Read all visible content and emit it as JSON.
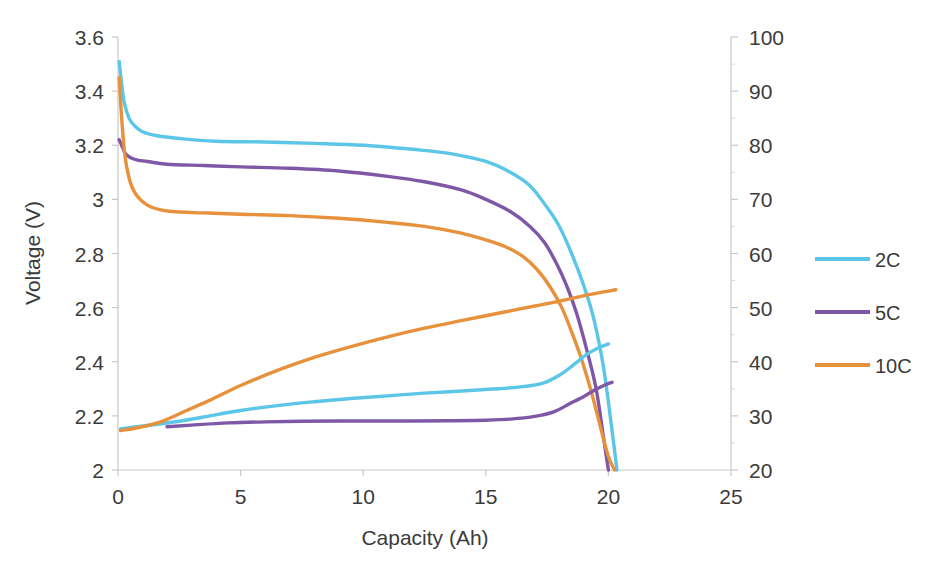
{
  "chart_data": {
    "type": "line",
    "title": "",
    "xlabel": "Capacity (Ah)",
    "ylabel": "Voltage (V)",
    "y2label": "",
    "xlim": [
      0,
      25
    ],
    "ylim": [
      2,
      3.6
    ],
    "y2lim": [
      20,
      100
    ],
    "grid": false,
    "legend_position": "right",
    "xticks": [
      "0",
      "5",
      "10",
      "15",
      "20",
      "25"
    ],
    "xtick_values": [
      0,
      5,
      10,
      15,
      20,
      25
    ],
    "yticks": [
      "2",
      "2.2",
      "2.4",
      "2.6",
      "2.8",
      "3",
      "3.2",
      "3.4",
      "3.6"
    ],
    "ytick_values": [
      2,
      2.2,
      2.4,
      2.6,
      2.8,
      3,
      3.2,
      3.4,
      3.6
    ],
    "y2ticks": [
      "20",
      "30",
      "40",
      "50",
      "60",
      "70",
      "80",
      "90",
      "100"
    ],
    "y2tick_values": [
      20,
      30,
      40,
      50,
      60,
      70,
      80,
      90,
      100
    ],
    "legend": [
      "2C",
      "5C",
      "10C"
    ],
    "colors": {
      "2C": "#5BC6E8",
      "5C": "#7E58A6",
      "10C": "#E8913D"
    },
    "series": [
      {
        "name": "2C discharge voltage",
        "legend": "2C",
        "color": "#5BC6E8",
        "axis": "left",
        "x": [
          0.05,
          0.12,
          0.25,
          0.45,
          0.7,
          1.0,
          1.6,
          2.5,
          4.0,
          6.0,
          8.0,
          10.0,
          12.0,
          13.5,
          15.0,
          16.0,
          16.8,
          17.5,
          18.0,
          18.5,
          19.0,
          19.4,
          19.8,
          20.1,
          20.35
        ],
        "y": [
          3.51,
          3.45,
          3.36,
          3.3,
          3.27,
          3.25,
          3.235,
          3.225,
          3.215,
          3.212,
          3.207,
          3.2,
          3.185,
          3.17,
          3.14,
          3.1,
          3.05,
          2.97,
          2.9,
          2.8,
          2.68,
          2.56,
          2.38,
          2.18,
          2.0
        ]
      },
      {
        "name": "5C discharge voltage",
        "legend": "5C",
        "color": "#7E58A6",
        "axis": "left",
        "x": [
          0.05,
          0.15,
          0.3,
          0.5,
          0.8,
          1.2,
          2.0,
          3.5,
          5.0,
          7.0,
          9.0,
          11.0,
          12.5,
          14.0,
          15.0,
          16.0,
          16.8,
          17.4,
          17.9,
          18.3,
          18.7,
          19.1,
          19.5,
          19.8,
          20.0
        ],
        "y": [
          3.22,
          3.2,
          3.17,
          3.155,
          3.145,
          3.14,
          3.13,
          3.125,
          3.12,
          3.115,
          3.105,
          3.085,
          3.065,
          3.035,
          3.0,
          2.955,
          2.9,
          2.84,
          2.76,
          2.68,
          2.58,
          2.45,
          2.3,
          2.12,
          2.0
        ]
      },
      {
        "name": "10C discharge voltage",
        "legend": "10C",
        "color": "#E8913D",
        "axis": "left",
        "x": [
          0.05,
          0.15,
          0.3,
          0.55,
          0.9,
          1.4,
          2.2,
          3.5,
          5.0,
          7.0,
          9.0,
          11.0,
          12.5,
          14.0,
          15.0,
          15.8,
          16.5,
          17.1,
          17.6,
          18.1,
          18.5,
          18.9,
          19.3,
          19.7,
          20.0,
          20.25
        ],
        "y": [
          3.45,
          3.3,
          3.15,
          3.05,
          3.0,
          2.97,
          2.955,
          2.95,
          2.945,
          2.94,
          2.93,
          2.915,
          2.9,
          2.875,
          2.85,
          2.825,
          2.79,
          2.74,
          2.68,
          2.6,
          2.51,
          2.41,
          2.29,
          2.15,
          2.05,
          2.0
        ]
      },
      {
        "name": "2C secondary curve",
        "legend": "2C",
        "color": "#5BC6E8",
        "axis": "right",
        "x": [
          0.1,
          0.6,
          1.5,
          2.5,
          3.5,
          5.0,
          6.5,
          8.0,
          9.5,
          11.0,
          12.5,
          14.0,
          15.5,
          16.5,
          17.3,
          18.0,
          18.6,
          19.1,
          19.6,
          20.0
        ],
        "y": [
          27.6,
          27.9,
          28.4,
          29.0,
          29.8,
          31.0,
          31.9,
          32.6,
          33.2,
          33.7,
          34.2,
          34.6,
          35.0,
          35.4,
          36.0,
          37.5,
          39.5,
          41.3,
          42.6,
          43.3
        ]
      },
      {
        "name": "5C secondary curve",
        "legend": "5C",
        "color": "#7E58A6",
        "axis": "right",
        "x": [
          2.0,
          3.0,
          4.5,
          6.0,
          7.5,
          9.0,
          10.5,
          12.0,
          13.5,
          15.0,
          16.0,
          17.0,
          17.8,
          18.4,
          19.0,
          19.5,
          19.9,
          20.15
        ],
        "y": [
          28.0,
          28.3,
          28.7,
          28.9,
          29.0,
          29.05,
          29.05,
          29.05,
          29.1,
          29.2,
          29.4,
          29.9,
          30.8,
          32.2,
          33.6,
          34.9,
          35.8,
          36.2
        ]
      },
      {
        "name": "10C secondary curve",
        "legend": "10C",
        "color": "#E8913D",
        "axis": "right",
        "x": [
          0.1,
          0.8,
          1.8,
          2.8,
          3.8,
          5.0,
          6.5,
          8.0,
          9.5,
          11.0,
          12.5,
          14.0,
          15.0,
          16.0,
          17.0,
          17.8,
          18.5,
          19.2,
          19.8,
          20.3
        ],
        "y": [
          27.3,
          27.8,
          29.0,
          31.0,
          33.0,
          35.6,
          38.4,
          40.8,
          42.8,
          44.6,
          46.2,
          47.6,
          48.5,
          49.4,
          50.3,
          51.0,
          51.7,
          52.4,
          52.9,
          53.3
        ]
      }
    ]
  },
  "legend_items": [
    {
      "label": "2C",
      "color": "#5BC6E8"
    },
    {
      "label": "5C",
      "color": "#7E58A6"
    },
    {
      "label": "10C",
      "color": "#E8913D"
    }
  ]
}
